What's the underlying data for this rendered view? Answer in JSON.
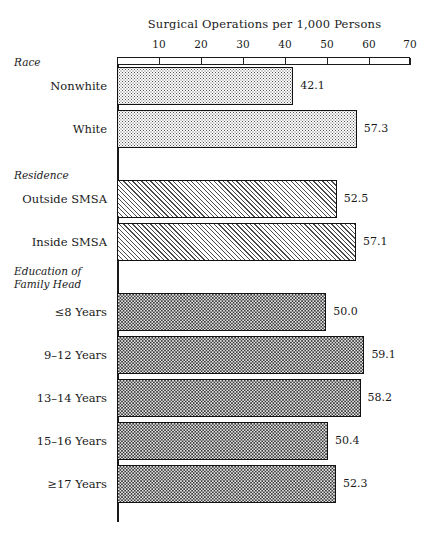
{
  "chart_data": {
    "type": "bar",
    "orientation": "horizontal",
    "title": "Surgical Operations per 1,000 Persons",
    "xlabel": "",
    "ylabel": "",
    "xlim": [
      0,
      70
    ],
    "xticks": [
      10,
      20,
      30,
      40,
      50,
      60,
      70
    ],
    "xtick_labels": [
      "10",
      "20",
      "30",
      "40",
      "50",
      "60",
      "70"
    ],
    "grid": false,
    "legend": "none",
    "groups": [
      {
        "header": "Race",
        "fill": "fine-dotted-light",
        "bars": [
          {
            "label": "Nonwhite",
            "value": 42.1,
            "value_label": "42.1"
          },
          {
            "label": "White",
            "value": 57.3,
            "value_label": "57.3"
          }
        ]
      },
      {
        "header": "Residence",
        "fill": "diagonal-hatch",
        "bars": [
          {
            "label": "Outside SMSA",
            "value": 52.5,
            "value_label": "52.5"
          },
          {
            "label": "Inside SMSA",
            "value": 57.1,
            "value_label": "57.1"
          }
        ]
      },
      {
        "header": "Education of\nFamily Head",
        "fill": "dense-dotted-dark",
        "bars": [
          {
            "label": "≤8 Years",
            "value": 50.0,
            "value_label": "50.0"
          },
          {
            "label": "9–12 Years",
            "value": 59.1,
            "value_label": "59.1"
          },
          {
            "label": "13–14 Years",
            "value": 58.2,
            "value_label": "58.2"
          },
          {
            "label": "15–16 Years",
            "value": 50.4,
            "value_label": "50.4"
          },
          {
            "label": "≥17 Years",
            "value": 52.3,
            "value_label": "52.3"
          }
        ]
      }
    ],
    "categories": [
      "Nonwhite",
      "White",
      "Outside SMSA",
      "Inside SMSA",
      "≤8 Years",
      "9–12 Years",
      "13–14 Years",
      "15–16 Years",
      "≥17 Years"
    ],
    "values": [
      42.1,
      57.3,
      52.5,
      57.1,
      50.0,
      59.1,
      58.2,
      50.4,
      52.3
    ],
    "colors": {
      "bar_outline": "#111111",
      "axis": "#1a1a1a",
      "text": "#1a1a1a",
      "background": "#ffffff"
    }
  },
  "layout": {
    "axis_x0_px": 117,
    "axis_x70_px": 410,
    "bar_height_px": 38,
    "bars_geometry": [
      {
        "top": 67
      },
      {
        "top": 110
      },
      {
        "top": 180
      },
      {
        "top": 223
      },
      {
        "top": 293
      },
      {
        "top": 336
      },
      {
        "top": 379
      },
      {
        "top": 422
      },
      {
        "top": 465
      }
    ],
    "group_header_tops": [
      56,
      169,
      265
    ],
    "tick_positions_px": [
      159,
      201,
      243,
      285,
      327,
      369,
      410
    ]
  }
}
